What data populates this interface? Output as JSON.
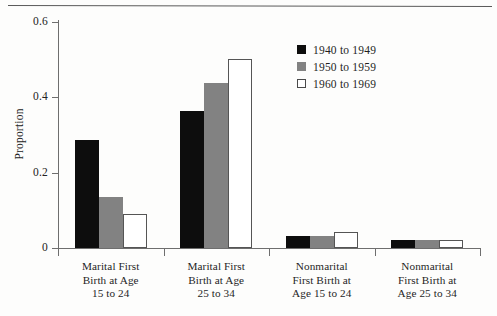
{
  "chart_data": {
    "type": "bar",
    "title": "",
    "subtitle": "",
    "xlabel": "",
    "ylabel": "Proportion",
    "ylim": [
      0,
      0.6
    ],
    "yticks": [
      "0",
      "0.2",
      "0.4",
      "0.6"
    ],
    "ytick_values": [
      0,
      0.2,
      0.4,
      0.6
    ],
    "grid": false,
    "legend_position": "top-right",
    "categories": [
      "Marital First\nBirth at Age\n15 to 24",
      "Marital First\nBirth at Age\n25 to 34",
      "Nonmarital\nFirst Birth at\nAge 15 to 24",
      "Nonmarital\nFirst Birth at\nAge 25 to 34"
    ],
    "category_lines": [
      [
        "Marital First",
        "Birth at Age",
        "15 to 24"
      ],
      [
        "Marital First",
        "Birth at Age",
        "25 to 34"
      ],
      [
        "Nonmarital",
        "First Birth at",
        "Age 15 to 24"
      ],
      [
        "Nonmarital",
        "First Birth at",
        "Age 25 to 34"
      ]
    ],
    "series": [
      {
        "name": "1940 to 1949",
        "color": "#0d0d0d",
        "values": [
          0.287,
          0.364,
          0.032,
          0.022
        ]
      },
      {
        "name": "1950 to 1959",
        "color": "#828282",
        "values": [
          0.135,
          0.439,
          0.032,
          0.022
        ]
      },
      {
        "name": "1960 to 1969",
        "color": "#ffffff",
        "values": [
          0.09,
          0.502,
          0.043,
          0.022
        ]
      }
    ]
  },
  "legend": {
    "entries": [
      {
        "label": "1940 to 1949",
        "swatch": "black"
      },
      {
        "label": "1950 to 1959",
        "swatch": "gray"
      },
      {
        "label": "1960 to 1969",
        "swatch": "white"
      }
    ]
  },
  "axes": {
    "y_title": "Proportion",
    "y_labels": [
      "0.6",
      "0.4",
      "0.2",
      "0"
    ]
  },
  "colors": {
    "series_1": "#0d0d0d",
    "series_2": "#828282",
    "series_3": "#ffffff",
    "axis": "#6e6e6e",
    "text": "#1f1f1f",
    "background": "#fdfdfc"
  }
}
